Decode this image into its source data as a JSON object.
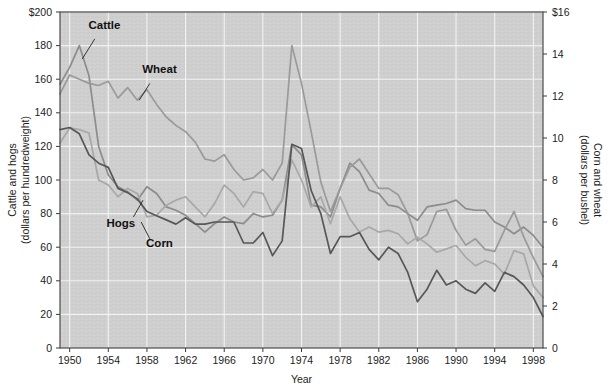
{
  "chart_data": {
    "type": "line",
    "title": "",
    "xlabel": "Year",
    "ylabel_left": "Cattle and hogs\n(dollars per hundredweight)",
    "ylabel_left_line1": "Cattle and hogs",
    "ylabel_left_line2": "(dollars per hundredweight)",
    "ylabel_right_line1": "Corn and wheat",
    "ylabel_right_line2": "(dollars per bushel)",
    "grid": true,
    "legend_position": "inline-annotations",
    "x": [
      1949,
      1950,
      1951,
      1952,
      1953,
      1954,
      1955,
      1956,
      1957,
      1958,
      1959,
      1960,
      1961,
      1962,
      1963,
      1964,
      1965,
      1966,
      1967,
      1968,
      1969,
      1970,
      1971,
      1972,
      1973,
      1974,
      1975,
      1976,
      1977,
      1978,
      1979,
      1980,
      1981,
      1982,
      1983,
      1984,
      1985,
      1986,
      1987,
      1988,
      1989,
      1990,
      1991,
      1992,
      1993,
      1994,
      1995,
      1996,
      1997,
      1998,
      1999
    ],
    "xlim": [
      1949,
      1999
    ],
    "xticks": [
      1950,
      1954,
      1958,
      1962,
      1966,
      1970,
      1974,
      1978,
      1982,
      1986,
      1990,
      1994,
      1998
    ],
    "xticklabels": [
      "1950",
      "1954",
      "1958",
      "1962",
      "1966",
      "1970",
      "1974",
      "1978",
      "1982",
      "1986",
      "1990",
      "1994",
      "1998"
    ],
    "ylim_left": [
      0,
      200
    ],
    "yticks_left": [
      0,
      20,
      40,
      60,
      80,
      100,
      120,
      140,
      160,
      180,
      200
    ],
    "yticklabels_left": [
      "0",
      "20",
      "40",
      "60",
      "80",
      "100",
      "120",
      "140",
      "160",
      "180",
      "$200"
    ],
    "ylim_right": [
      0,
      16
    ],
    "yticks_right": [
      0,
      2,
      4,
      6,
      8,
      10,
      12,
      14,
      16
    ],
    "yticklabels_right": [
      "0",
      "2",
      "4",
      "6",
      "8",
      "10",
      "12",
      "14",
      "$16"
    ],
    "series": [
      {
        "name": "Cattle",
        "axis": "left",
        "color": "#8c8c8c",
        "label_x": 1953.6,
        "label_y_left": 190,
        "leader_from_x": 1952.6,
        "leader_from_y_left": 184,
        "leader_to_x": 1951.3,
        "leader_to_y_left": 172,
        "values": [
          157,
          167,
          180,
          162,
          120,
          103,
          96,
          93,
          88,
          96,
          92,
          84,
          82,
          79,
          74,
          69,
          74,
          78,
          75,
          74,
          80,
          78,
          79,
          88,
          121,
          115,
          85,
          84,
          78,
          95,
          110,
          105,
          94,
          92,
          85,
          84,
          80,
          76,
          84,
          85,
          86,
          88,
          83,
          82,
          82,
          75,
          72,
          68,
          72,
          67,
          60
        ]
      },
      {
        "name": "Wheat",
        "axis": "right",
        "color": "#9a9a9a",
        "label_x": 1959.3,
        "label_y_right": 13.1,
        "leader_from_x": 1958.3,
        "leader_from_y_right": 12.6,
        "leader_to_x": 1957.2,
        "leader_to_y_right": 11.8,
        "values": [
          12.1,
          13.0,
          12.8,
          12.6,
          12.5,
          12.7,
          11.9,
          12.4,
          11.8,
          12.3,
          11.6,
          11.0,
          10.6,
          10.3,
          9.8,
          9.0,
          8.9,
          9.2,
          8.5,
          8.0,
          8.1,
          8.5,
          8.0,
          8.8,
          14.4,
          12.6,
          10.3,
          7.9,
          6.5,
          7.6,
          8.6,
          9.0,
          8.3,
          7.6,
          7.6,
          7.3,
          6.4,
          5.1,
          5.4,
          6.5,
          6.6,
          5.6,
          4.9,
          5.2,
          4.7,
          4.6,
          5.6,
          6.5,
          5.3,
          4.3,
          3.4
        ]
      },
      {
        "name": "Hogs",
        "axis": "left",
        "color": "#a8a8a8",
        "label_x": 1955.3,
        "label_y_left": 72,
        "leader_from_x": 1956.6,
        "leader_from_y_left": 78,
        "leader_to_x": 1957.6,
        "leader_to_y_left": 88,
        "values": [
          122,
          131,
          130,
          128,
          100,
          97,
          90,
          95,
          92,
          78,
          79,
          85,
          88,
          90,
          84,
          78,
          86,
          97,
          92,
          84,
          93,
          92,
          80,
          88,
          112,
          100,
          84,
          90,
          74,
          90,
          77,
          69,
          72,
          69,
          70,
          68,
          62,
          66,
          62,
          57,
          59,
          61,
          54,
          49,
          52,
          50,
          44,
          58,
          56,
          37,
          30
        ]
      },
      {
        "name": "Corn",
        "axis": "right",
        "color": "#575757",
        "label_x": 1959.3,
        "label_y_right": 4.8,
        "leader_from_x": 1958.3,
        "leader_from_y_right": 5.2,
        "leader_to_x": 1957.4,
        "leader_to_y_right": 6.0,
        "values": [
          10.4,
          10.5,
          10.2,
          9.2,
          8.8,
          8.6,
          7.6,
          7.4,
          7.1,
          6.5,
          6.3,
          6.1,
          5.9,
          6.2,
          5.9,
          5.9,
          6.0,
          6.0,
          6.0,
          5.0,
          5.0,
          5.5,
          4.4,
          5.1,
          9.7,
          9.5,
          7.5,
          6.4,
          4.5,
          5.3,
          5.3,
          5.5,
          4.7,
          4.2,
          4.8,
          4.5,
          3.6,
          2.2,
          2.8,
          3.7,
          3.0,
          3.2,
          2.8,
          2.6,
          3.1,
          2.7,
          3.6,
          3.4,
          3.0,
          2.4,
          1.5
        ]
      }
    ]
  },
  "axes": {
    "xlabel": "Year",
    "left_title_line1": "Cattle and hogs",
    "left_title_line2": "(dollars per hundredweight)",
    "right_title_line1": "Corn and wheat",
    "right_title_line2": "(dollars per bushel)"
  }
}
